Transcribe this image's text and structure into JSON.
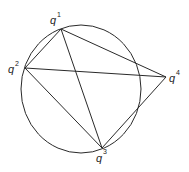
{
  "diagram": {
    "type": "cyclic quadrilateral construction",
    "stroke_color": "#2a2a2a",
    "background": "#ffffff",
    "circle": {
      "cx": 81,
      "cy": 89,
      "rx": 60,
      "ry": 64
    },
    "points": [
      {
        "id": "q1",
        "base": "q",
        "index": "1",
        "x": 61,
        "y": 29,
        "label_x": 50,
        "label_y": 24,
        "sup_x": 57,
        "sup_y": 17
      },
      {
        "id": "q2",
        "base": "q",
        "index": "2",
        "x": 25,
        "y": 68,
        "label_x": 8,
        "label_y": 73,
        "sup_x": 15,
        "sup_y": 66
      },
      {
        "id": "q3",
        "base": "q",
        "index": "3",
        "x": 102,
        "y": 148,
        "label_x": 96,
        "label_y": 162,
        "sup_x": 103,
        "sup_y": 154
      },
      {
        "id": "q4",
        "base": "q",
        "index": "4",
        "x": 166,
        "y": 77,
        "label_x": 169,
        "label_y": 82,
        "sup_x": 176,
        "sup_y": 75
      }
    ],
    "segments": [
      {
        "from": "q1",
        "to": "q2"
      },
      {
        "from": "q1",
        "to": "q3"
      },
      {
        "from": "q1",
        "to": "q4"
      },
      {
        "from": "q2",
        "to": "q3"
      },
      {
        "from": "q2",
        "to": "q4"
      },
      {
        "from": "q3",
        "to": "q4"
      }
    ]
  }
}
